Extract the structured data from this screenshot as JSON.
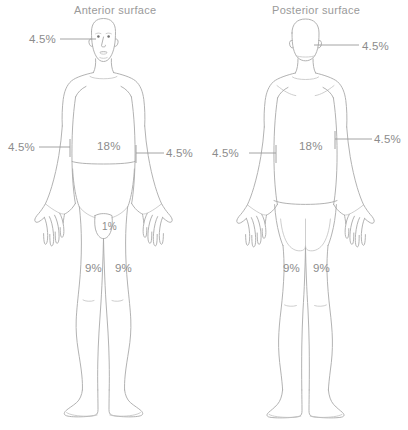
{
  "diagram": {
    "type": "rule-of-nines-burn-chart",
    "figures": [
      {
        "id": "anterior",
        "title": "Anterior surface",
        "labels": {
          "head": "4.5%",
          "arm_left": "4.5%",
          "arm_right": "4.5%",
          "trunk": "18%",
          "genitalia": "1%",
          "leg_left": "9%",
          "leg_right": "9%"
        }
      },
      {
        "id": "posterior",
        "title": "Posterior surface",
        "labels": {
          "head": "4.5%",
          "arm_left": "4.5%",
          "arm_right": "4.5%",
          "trunk": "18%",
          "leg_left": "9%",
          "leg_right": "9%"
        }
      }
    ],
    "colors": {
      "outline": "#a9a9a9",
      "outline_soft": "#c2c2c2",
      "text": "#8c8c8c",
      "title_text": "#9a9a9a",
      "background": "#ffffff"
    }
  }
}
